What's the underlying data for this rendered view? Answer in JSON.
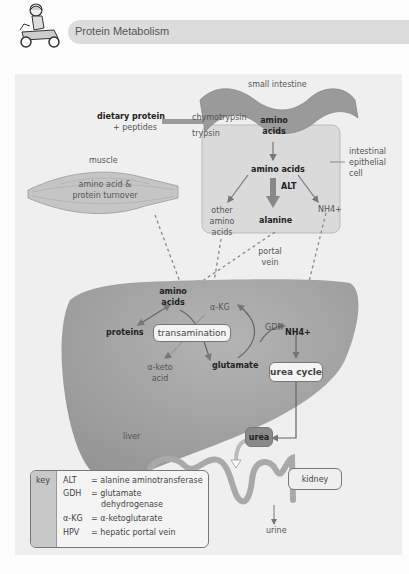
{
  "header": {
    "title": "Protein Metabolism",
    "logo_icon": "scooter-rider-icon"
  },
  "colors": {
    "panel_bg": "#efefef",
    "organ_fill": "#9c9c9c",
    "cell_fill": "#d9d9d9",
    "arrow": "#777777",
    "urea_box": "#8a8a8a"
  },
  "diagram": {
    "small_intestine": "small intestine",
    "dietary_protein": "dietary protein",
    "peptides": "+ peptides",
    "chymotrypsin": "chymotrypsin",
    "trypsin": "trypsin",
    "intestine_amino": "amino",
    "intestine_acids": "acids",
    "epithelial_1": "intestinal",
    "epithelial_2": "epithelial",
    "epithelial_3": "cell",
    "cell_amino_acids": "amino acids",
    "alt": "ALT",
    "other_1": "other",
    "other_2": "amino",
    "other_3": "acids",
    "alanine": "alanine",
    "nh4_cell": "NH4+",
    "portal_1": "portal",
    "portal_2": "vein",
    "muscle": "muscle",
    "muscle_text_1": "amino acid &",
    "muscle_text_2": "protein turnover",
    "liver_amino": "amino",
    "liver_acids": "acids",
    "alpha_kg": "α-KG",
    "proteins": "proteins",
    "transamination": "transamination",
    "alpha_keto_1": "α-keto",
    "alpha_keto_2": "acid",
    "glutamate": "glutamate",
    "gdh": "GDH",
    "nh4_liver": "NH4+",
    "urea_cycle": "urea cycle",
    "liver": "liver",
    "urea": "urea",
    "kidney": "kidney",
    "urine": "urine"
  },
  "key": {
    "title": "key",
    "rows": [
      {
        "abbr": "ALT",
        "def": "= alanine aminotransferase"
      },
      {
        "abbr": "GDH",
        "def": "= glutamate"
      },
      {
        "abbr": "",
        "def": "dehydrogenase"
      },
      {
        "abbr": "α-KG",
        "def": "= α-ketoglutarate"
      },
      {
        "abbr": "HPV",
        "def": "= hepatic portal vein"
      }
    ]
  }
}
